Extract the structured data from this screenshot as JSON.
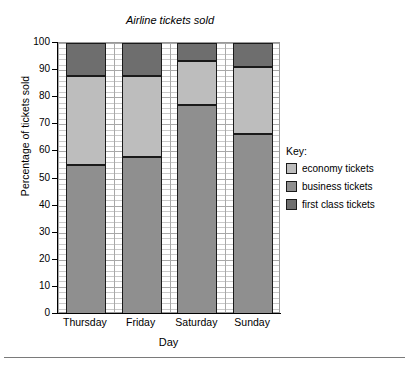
{
  "chart_data": {
    "type": "bar",
    "subtype": "stacked-percentage",
    "title": "Airline tickets sold",
    "xlabel": "Day",
    "ylabel": "Percentage of tickets sold",
    "categories": [
      "Thursday",
      "Friday",
      "Saturday",
      "Sunday"
    ],
    "ylim": [
      0,
      100
    ],
    "ytick_values": [
      0,
      10,
      20,
      30,
      40,
      50,
      60,
      70,
      80,
      90,
      100
    ],
    "ytick_labels": [
      "0",
      "10",
      "20",
      "30",
      "40",
      "50",
      "60",
      "70",
      "80",
      "90",
      "100"
    ],
    "grid": true,
    "grid_minor_step": 2,
    "legend_position": "right",
    "legend_title": "Key:",
    "stack_order_bottom_to_top": [
      "business tickets",
      "economy tickets",
      "first class tickets"
    ],
    "series": [
      {
        "name": "business tickets",
        "color": "#8f8f8f",
        "values": [
          55,
          58,
          77,
          66.5
        ]
      },
      {
        "name": "economy tickets",
        "color": "#bdbdbd",
        "values": [
          33,
          30,
          16.5,
          24.5
        ]
      },
      {
        "name": "first class tickets",
        "color": "#6e6e6e",
        "values": [
          12,
          12,
          6.5,
          9
        ]
      }
    ],
    "cumulative_boundaries": [
      {
        "category": "Thursday",
        "breaks": [
          55,
          88,
          100
        ]
      },
      {
        "category": "Friday",
        "breaks": [
          58,
          88,
          100
        ]
      },
      {
        "category": "Saturday",
        "breaks": [
          77,
          93.5,
          100
        ]
      },
      {
        "category": "Sunday",
        "breaks": [
          66.5,
          91,
          100
        ]
      }
    ]
  },
  "legend": {
    "title": "Key:",
    "items": [
      {
        "label": "economy tickets",
        "color": "#bdbdbd"
      },
      {
        "label": "business tickets",
        "color": "#8f8f8f"
      },
      {
        "label": "first class tickets",
        "color": "#6e6e6e"
      }
    ]
  }
}
